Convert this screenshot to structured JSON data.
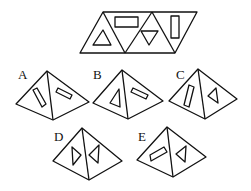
{
  "puzzle": {
    "net": {
      "description": "Unfolded pyramid net: parallelogram of four triangles",
      "faces": [
        {
          "position": 1,
          "orientation": "up",
          "symbol": "triangle-up"
        },
        {
          "position": 2,
          "orientation": "down",
          "symbol": "rectangle-horizontal"
        },
        {
          "position": 3,
          "orientation": "up",
          "symbol": "triangle-down"
        },
        {
          "position": 4,
          "orientation": "down",
          "symbol": "rectangle-vertical"
        }
      ]
    },
    "options": [
      {
        "label": "A",
        "left_face": "rectangle",
        "right_face": "rectangle"
      },
      {
        "label": "B",
        "left_face": "triangle",
        "right_face": "rectangle"
      },
      {
        "label": "C",
        "left_face": "rectangle",
        "right_face": "triangle"
      },
      {
        "label": "D",
        "left_face": "triangle",
        "right_face": "triangle"
      },
      {
        "label": "E",
        "left_face": "rectangle",
        "right_face": "triangle"
      }
    ]
  }
}
